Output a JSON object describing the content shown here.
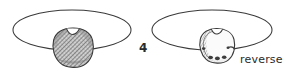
{
  "figure": {
    "number_label": "4",
    "reverse_caption": "reverse",
    "background_color": "#ffffff",
    "ink_color": "#2b2b2b",
    "line_color": "#3a3a3a",
    "hatch_color": "#555555",
    "shade_fill": "#c9c9c9",
    "light_fill": "#f2f2f2"
  },
  "panels": [
    {
      "id": "obverse-panel",
      "name": "obverse",
      "ellipse": {
        "cx": 72,
        "cy": 30,
        "rx": 59,
        "ry": 20
      },
      "coin": {
        "cx": 73,
        "cy": 48,
        "r": 20,
        "notched": true,
        "shading": "dense-diagonal-hatch"
      },
      "caption": ""
    },
    {
      "id": "reverse-panel",
      "name": "reverse",
      "ellipse": {
        "cx": 212,
        "cy": 30,
        "rx": 60,
        "ry": 20
      },
      "coin": {
        "cx": 217,
        "cy": 46,
        "r": 18,
        "notched": true,
        "shading": "light-with-marks"
      },
      "caption": "reverse"
    }
  ]
}
